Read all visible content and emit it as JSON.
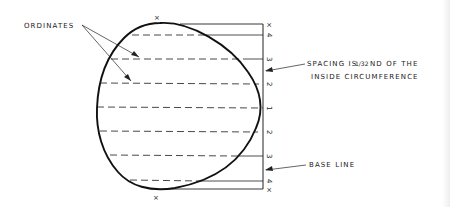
{
  "diagram": {
    "labels": {
      "ordinates": "ORDINATES",
      "spacing_line1": "SPACING IS",
      "spacing_fraction": "1/32",
      "spacing_suffix": "ND  OF  THE",
      "spacing_line2": "INSIDE  CIRCUMFERENCE",
      "base_line": "BASE LINE"
    },
    "end_marks": {
      "top_curve": "×",
      "bottom_curve": "×",
      "top_baseline": "×",
      "bottom_baseline": "×"
    },
    "ordinate_numbers": [
      "4",
      "3",
      "2",
      "1",
      "2",
      "3",
      "4"
    ],
    "colors": {
      "ink": "#222222",
      "background": "#ffffff"
    }
  }
}
